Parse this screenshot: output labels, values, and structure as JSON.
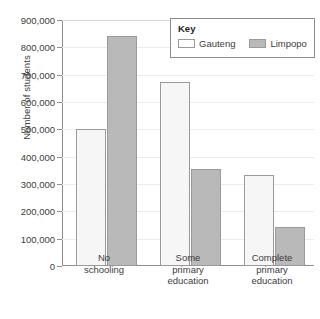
{
  "chart_data": {
    "type": "bar",
    "title": "",
    "xlabel": "",
    "ylabel": "Number of students",
    "categories": [
      "No\nschooling",
      "Some\nprimary\neducation",
      "Complete\nprimary\neducation"
    ],
    "category_lines": [
      [
        "No",
        "schooling"
      ],
      [
        "Some",
        "primary",
        "education"
      ],
      [
        "Complete",
        "primary",
        "education"
      ]
    ],
    "series": [
      {
        "name": "Gauteng",
        "color": "#f6f6f6",
        "values": [
          500000,
          675000,
          333000
        ]
      },
      {
        "name": "Limpopo",
        "color": "#b9b9b9",
        "values": [
          840000,
          355000,
          142000
        ]
      }
    ],
    "ylim": [
      0,
      900000
    ],
    "ytick_step": 100000,
    "ytick_labels": [
      "900,000",
      "800,000",
      "700,000",
      "600,000",
      "500,000",
      "400,000",
      "300,000",
      "200,000",
      "100,000",
      "0"
    ],
    "ytick_values": [
      900000,
      800000,
      700000,
      600000,
      500000,
      400000,
      300000,
      200000,
      100000,
      0
    ],
    "grid": true,
    "legend_position": "top-right"
  },
  "legend": {
    "title": "Key",
    "entries": [
      {
        "label": "Gauteng"
      },
      {
        "label": "Limpopo"
      }
    ]
  }
}
